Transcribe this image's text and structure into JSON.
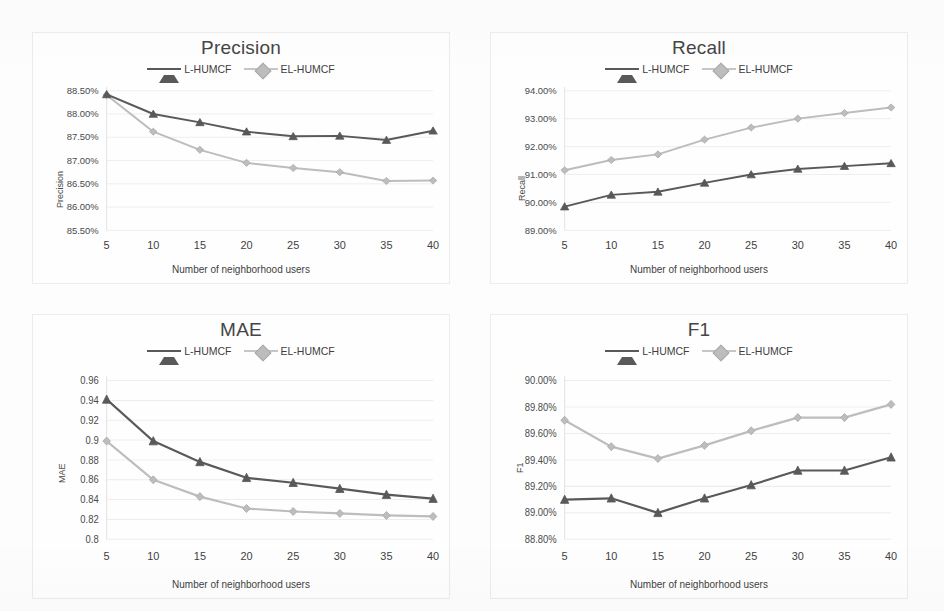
{
  "figure": {
    "panels_count": 4,
    "series_names": [
      "L-HUMCF",
      "EL-HUMCF"
    ],
    "series_colors": [
      "#595959",
      "#bdbdbd"
    ],
    "xaxis_title": "Number of neighborhood users"
  },
  "legend": {
    "entry1_label": "L-HUMCF",
    "entry2_label": "EL-HUMCF"
  },
  "chart_data": [
    {
      "type": "line",
      "title": "Precision",
      "xlabel": "Number of neighborhood users",
      "ylabel": "Precision",
      "x": [
        5,
        10,
        15,
        20,
        25,
        30,
        35,
        40
      ],
      "xtick_labels": [
        "5",
        "10",
        "15",
        "20",
        "25",
        "30",
        "35",
        "40"
      ],
      "ytick_labels": [
        "85.50%",
        "86.00%",
        "86.50%",
        "87.00%",
        "87.50%",
        "88.00%",
        "88.50%"
      ],
      "ytick_values": [
        85.5,
        86.0,
        86.5,
        87.0,
        87.5,
        88.0,
        88.5
      ],
      "ylim": [
        85.5,
        88.5
      ],
      "grid": true,
      "legend_position": "top-center",
      "series": [
        {
          "name": "L-HUMCF",
          "marker": "triangle",
          "color": "#595959",
          "values": [
            88.42,
            88.0,
            87.82,
            87.62,
            87.52,
            87.53,
            87.44,
            87.64
          ]
        },
        {
          "name": "EL-HUMCF",
          "marker": "diamond",
          "color": "#bdbdbd",
          "values": [
            88.41,
            87.62,
            87.23,
            86.95,
            86.84,
            86.75,
            86.56,
            86.57
          ]
        }
      ]
    },
    {
      "type": "line",
      "title": "Recall",
      "xlabel": "Number of neighborhood users",
      "ylabel": "Recall",
      "x": [
        5,
        10,
        15,
        20,
        25,
        30,
        35,
        40
      ],
      "xtick_labels": [
        "5",
        "10",
        "15",
        "20",
        "25",
        "30",
        "35",
        "40"
      ],
      "ytick_labels": [
        "89.00%",
        "90.00%",
        "91.00%",
        "92.00%",
        "93.00%",
        "94.00%"
      ],
      "ytick_values": [
        89.0,
        90.0,
        91.0,
        92.0,
        93.0,
        94.0
      ],
      "ylim": [
        89.0,
        94.0
      ],
      "grid": true,
      "legend_position": "top-center",
      "series": [
        {
          "name": "L-HUMCF",
          "marker": "triangle",
          "color": "#595959",
          "values": [
            89.85,
            90.27,
            90.38,
            90.7,
            91.0,
            91.2,
            91.3,
            91.4
          ]
        },
        {
          "name": "EL-HUMCF",
          "marker": "diamond",
          "color": "#bdbdbd",
          "values": [
            91.15,
            91.52,
            91.72,
            92.25,
            92.68,
            93.0,
            93.2,
            93.4
          ]
        }
      ]
    },
    {
      "type": "line",
      "title": "MAE",
      "xlabel": "Number of neighborhood users",
      "ylabel": "MAE",
      "x": [
        5,
        10,
        15,
        20,
        25,
        30,
        35,
        40
      ],
      "xtick_labels": [
        "5",
        "10",
        "15",
        "20",
        "25",
        "30",
        "35",
        "40"
      ],
      "ytick_labels": [
        "0.8",
        "0.82",
        "0.84",
        "0.86",
        "0.88",
        "0.9",
        "0.92",
        "0.94",
        "0.96"
      ],
      "ytick_values": [
        0.8,
        0.82,
        0.84,
        0.86,
        0.88,
        0.9,
        0.92,
        0.94,
        0.96
      ],
      "ylim": [
        0.8,
        0.96
      ],
      "grid": true,
      "legend_position": "top-center",
      "series": [
        {
          "name": "L-HUMCF",
          "marker": "triangle",
          "color": "#595959",
          "values": [
            0.941,
            0.899,
            0.878,
            0.862,
            0.857,
            0.851,
            0.845,
            0.841
          ]
        },
        {
          "name": "EL-HUMCF",
          "marker": "diamond",
          "color": "#bdbdbd",
          "values": [
            0.899,
            0.86,
            0.843,
            0.831,
            0.828,
            0.826,
            0.824,
            0.823
          ]
        }
      ]
    },
    {
      "type": "line",
      "title": "F1",
      "xlabel": "Number of neighborhood users",
      "ylabel": "F1",
      "x": [
        5,
        10,
        15,
        20,
        25,
        30,
        35,
        40
      ],
      "xtick_labels": [
        "5",
        "10",
        "15",
        "20",
        "25",
        "30",
        "35",
        "40"
      ],
      "ytick_labels": [
        "88.80%",
        "89.00%",
        "89.20%",
        "89.40%",
        "89.60%",
        "89.80%",
        "90.00%"
      ],
      "ytick_values": [
        88.8,
        89.0,
        89.2,
        89.4,
        89.6,
        89.8,
        90.0
      ],
      "ylim": [
        88.8,
        90.0
      ],
      "grid": true,
      "legend_position": "top-center",
      "series": [
        {
          "name": "L-HUMCF",
          "marker": "triangle",
          "color": "#595959",
          "values": [
            89.1,
            89.11,
            89.0,
            89.11,
            89.21,
            89.32,
            89.32,
            89.42
          ]
        },
        {
          "name": "EL-HUMCF",
          "marker": "diamond",
          "color": "#bdbdbd",
          "values": [
            89.7,
            89.5,
            89.41,
            89.51,
            89.62,
            89.72,
            89.72,
            89.82
          ]
        }
      ]
    }
  ]
}
